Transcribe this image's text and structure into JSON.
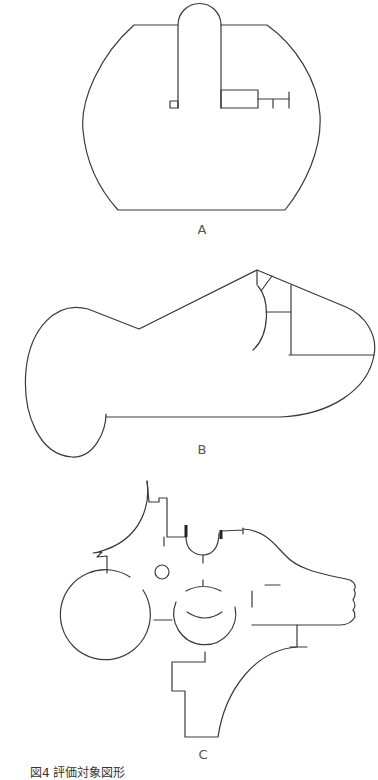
{
  "figure": {
    "caption": "図4 評価対象図形",
    "shapes": [
      {
        "id": "A",
        "label": "A"
      },
      {
        "id": "B",
        "label": "B"
      },
      {
        "id": "C",
        "label": "C"
      }
    ],
    "line_color": "#3a3a3a",
    "background": "#ffffff"
  }
}
